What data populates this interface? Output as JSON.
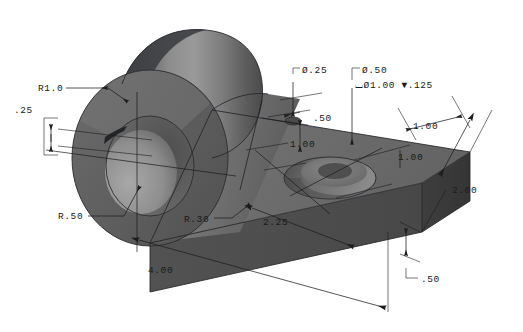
{
  "drawing": {
    "title": "Isometric shaded part view",
    "background_color": "#ffffff",
    "line_color": "#1d1d1d",
    "units": "inch (decimal)",
    "projection": "isometric"
  },
  "part": {
    "name": "clevis-mounting-block",
    "description": "Rectangular base plate with cylindrical boss and through bore",
    "surface_colors": {
      "top_face": "#6d6d6d",
      "front_face": "#4c4c4c",
      "right_end_face": "#3b3b3b",
      "boss_light": "#8e8e8e",
      "boss_mid": "#6f6f6f",
      "boss_dark": "#4a4a4a",
      "boss_top_dark": "#3f4043",
      "bore_inner": "#9a9a9a",
      "bore_shadow": "#5a5a5a",
      "counterbore_wall": "#5e5e5e",
      "counterbore_floor": "#7c7c7c",
      "pilot_hole": "#565656"
    }
  },
  "dimensions": [
    {
      "id": "r1-0",
      "label": "R1.0",
      "type": "radius",
      "value": 1.0,
      "feature": "boss-outer-radius"
    },
    {
      "id": "d-25",
      "label": ".25",
      "type": "linear",
      "value": 0.25,
      "feature": "boss-wall-thickness"
    },
    {
      "id": "r-50",
      "label": "R.50",
      "type": "radius",
      "value": 0.5,
      "feature": "bore-radius"
    },
    {
      "id": "r-30",
      "label": "R.30",
      "type": "radius",
      "value": 0.3,
      "feature": "fillet-radius"
    },
    {
      "id": "dia-25",
      "label": "Ø.25",
      "type": "diameter",
      "value": 0.25,
      "feature": "small-through-hole"
    },
    {
      "id": "dia-50",
      "label": "Ø.50",
      "type": "diameter",
      "value": 0.5,
      "feature": "counterbored-hole"
    },
    {
      "id": "cbore",
      "label": "⌴Ø1.00 ▼.125",
      "type": "counterbore",
      "value": 1.0,
      "depth": 0.125,
      "feature": "counterbore"
    },
    {
      "id": "d-50-top",
      "label": ".50",
      "type": "linear",
      "value": 0.5,
      "feature": "hole-edge-offset"
    },
    {
      "id": "d-100-a",
      "label": "1.00",
      "type": "linear",
      "value": 1.0,
      "feature": "hole-spacing"
    },
    {
      "id": "d-100-b",
      "label": "1.00",
      "type": "linear",
      "value": 1.0,
      "feature": "cbore-from-end"
    },
    {
      "id": "d-100-c",
      "label": "1.00",
      "type": "linear",
      "value": 1.0,
      "feature": "cbore-from-front"
    },
    {
      "id": "d-200",
      "label": "2.00",
      "type": "linear",
      "value": 2.0,
      "feature": "plate-width"
    },
    {
      "id": "d-225",
      "label": "2.25",
      "type": "linear",
      "value": 2.25,
      "feature": "plate-length-partial"
    },
    {
      "id": "d-400",
      "label": "4.00",
      "type": "linear",
      "value": 4.0,
      "feature": "overall-length"
    },
    {
      "id": "d-50-bot",
      "label": ".50",
      "type": "linear",
      "value": 0.5,
      "feature": "plate-thickness"
    }
  ]
}
